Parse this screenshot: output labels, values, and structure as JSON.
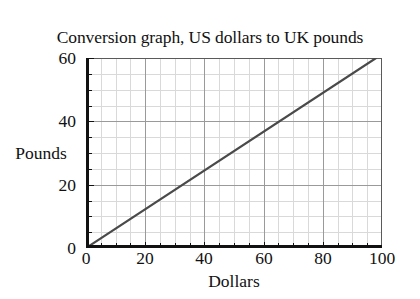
{
  "chart_data": {
    "type": "line",
    "title": "Conversion graph, US dollars to UK pounds",
    "xlabel": "Dollars",
    "ylabel": "Pounds",
    "xlim": [
      0,
      100
    ],
    "ylim": [
      0,
      60
    ],
    "xticks": [
      0,
      20,
      40,
      60,
      80,
      100
    ],
    "yticks": [
      0,
      20,
      40,
      60
    ],
    "xtick_labels": [
      "0",
      "20",
      "40",
      "60",
      "80",
      "100"
    ],
    "ytick_labels": [
      "0",
      "20",
      "40",
      "60"
    ],
    "x_major_step": 20,
    "x_minor_step": 5,
    "y_major_step": 20,
    "y_minor_step": 5,
    "grid": "major-and-minor",
    "legend": "none",
    "series": [
      {
        "name": "US dollars to UK pounds",
        "x": [
          0,
          98
        ],
        "values": [
          0,
          60
        ],
        "slope": 0.612,
        "intercept": 0,
        "color": "#4a4a4a",
        "line_width": 2.2
      }
    ],
    "colors": {
      "line": "#4a4a4a",
      "axis": "#111111",
      "major_grid": "#9a9a9a",
      "minor_grid": "#d9d9d9",
      "background": "#ffffff",
      "text": "#111111"
    }
  }
}
